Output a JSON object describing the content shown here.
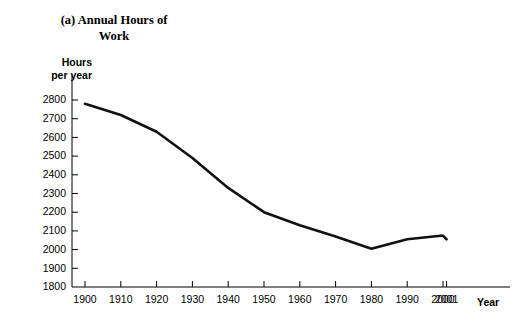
{
  "chart_data": {
    "type": "line",
    "title": "(a) Annual Hours of\nWork",
    "ylabel": "Hours\nper year",
    "xlabel": "Year",
    "grid": false,
    "legend": null,
    "ylim": [
      1800,
      2800
    ],
    "ytick_step": 100,
    "ytick_labels": [
      "2800",
      "2700",
      "2600",
      "2500",
      "2400",
      "2300",
      "2200",
      "2100",
      "2000",
      "1900",
      "1800"
    ],
    "ytick_values": [
      2800,
      2700,
      2600,
      2500,
      2400,
      2300,
      2200,
      2100,
      2000,
      1900,
      1800
    ],
    "xtick_labels": [
      "1900",
      "1910",
      "1920",
      "1930",
      "1940",
      "1950",
      "1960",
      "1970",
      "1980",
      "1990",
      "2000",
      "2001"
    ],
    "x": [
      1900,
      1910,
      1920,
      1930,
      1940,
      1950,
      1960,
      1970,
      1980,
      1990,
      2000,
      2001
    ],
    "values": [
      2780,
      2720,
      2630,
      2490,
      2330,
      2200,
      2130,
      2070,
      2005,
      2055,
      2075,
      2055
    ],
    "series": [
      {
        "name": "Annual hours of work",
        "values": [
          2780,
          2720,
          2630,
          2490,
          2330,
          2200,
          2130,
          2070,
          2005,
          2055,
          2075,
          2055
        ],
        "color": "#111111"
      }
    ]
  },
  "colors": {
    "line": "#111111",
    "axis": "#000000",
    "background": "#ffffff"
  }
}
